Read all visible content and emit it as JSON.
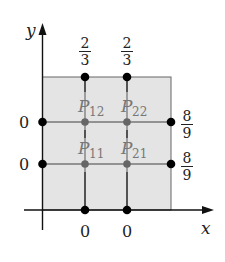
{
  "diagram": {
    "axes": {
      "x_label": "x",
      "y_label": "y"
    },
    "region": {
      "fill_color": "#e4e4e4",
      "edge_color": "#555555"
    },
    "boundary_values": {
      "top": [
        "2",
        "3",
        "2",
        "3"
      ],
      "top_fractions": [
        {
          "num": "2",
          "den": "3"
        },
        {
          "num": "2",
          "den": "3"
        }
      ],
      "left": [
        "0",
        "0"
      ],
      "right_fractions": [
        {
          "num": "8",
          "den": "9"
        },
        {
          "num": "8",
          "den": "9"
        }
      ],
      "bottom": [
        "0",
        "0"
      ]
    },
    "interior_points": [
      {
        "label": "P",
        "sub": "12"
      },
      {
        "label": "P",
        "sub": "22"
      },
      {
        "label": "P",
        "sub": "11"
      },
      {
        "label": "P",
        "sub": "21"
      }
    ],
    "colors": {
      "boundary_dot": "#000000",
      "interior_dot": "#666666",
      "interior_label": "#777777",
      "grid_line": "#777777",
      "axis": "#111111"
    }
  }
}
